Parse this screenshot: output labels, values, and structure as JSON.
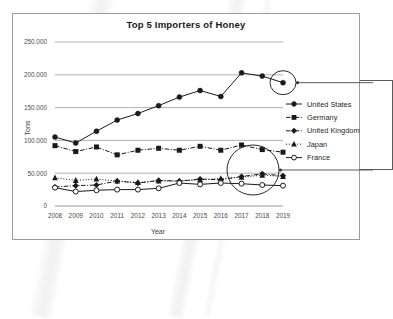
{
  "chart_data": {
    "type": "line",
    "title": "Top 5 Importers of Honey",
    "xlabel": "Year",
    "ylabel": "Tons",
    "categories": [
      "2008",
      "2009",
      "2010",
      "2011",
      "2012",
      "2013",
      "2014",
      "2015",
      "2016",
      "2017",
      "2018",
      "2019"
    ],
    "ylim": [
      0,
      250000
    ],
    "ytick_labels": [
      "0",
      "50.000",
      "100.000",
      "150.000",
      "200.000",
      "250.000"
    ],
    "ytick_values": [
      0,
      50000,
      100000,
      150000,
      200000,
      250000
    ],
    "grid": true,
    "legend_position": "right",
    "series": [
      {
        "name": "United States",
        "marker": "filled-circle",
        "line_style": "solid",
        "color": "#1a1a1a",
        "values": [
          105000,
          96000,
          114000,
          131000,
          141000,
          153000,
          166000,
          176000,
          167000,
          203000,
          198000,
          188000
        ]
      },
      {
        "name": "Germany",
        "marker": "filled-square",
        "line_style": "dash-dot",
        "color": "#1a1a1a",
        "values": [
          92000,
          83000,
          90000,
          78000,
          85000,
          88000,
          85000,
          91000,
          85000,
          93000,
          86000,
          82000
        ]
      },
      {
        "name": "United Kingdom",
        "marker": "filled-diamond",
        "line_style": "dash-dot",
        "color": "#1a1a1a",
        "values": [
          29000,
          31000,
          32000,
          38000,
          35000,
          39000,
          38000,
          41000,
          40000,
          45000,
          49000,
          46000
        ]
      },
      {
        "name": "Japan",
        "marker": "filled-triangle",
        "line_style": "dotted",
        "color": "#1a1a1a",
        "values": [
          43000,
          39000,
          41000,
          38000,
          36000,
          38000,
          38000,
          40000,
          42000,
          44000,
          47000,
          45000
        ]
      },
      {
        "name": "France",
        "marker": "open-circle",
        "line_style": "solid",
        "color": "#1a1a1a",
        "values": [
          28000,
          22000,
          24000,
          25000,
          25000,
          27000,
          35000,
          33000,
          35000,
          34000,
          32000,
          31000
        ]
      }
    ],
    "annotations": [
      {
        "name": "highlight-united-states-2019",
        "shape": "ellipse",
        "target_series": "United States",
        "target_year": "2019"
      },
      {
        "name": "highlight-2018-2019-cluster",
        "shape": "ellipse",
        "target_year": "2019"
      }
    ]
  },
  "colors": {
    "frame": "#9a9a9a",
    "grid": "#8f8f8f",
    "ink": "#1a1a1a",
    "callout": "#5a5a5a"
  }
}
